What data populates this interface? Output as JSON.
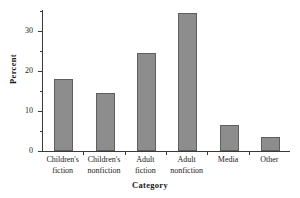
{
  "chart_data": {
    "type": "bar",
    "title": "",
    "xlabel": "Category",
    "ylabel": "Percent",
    "categories": [
      "Children's fiction",
      "Children's nonfiction",
      "Adult fiction",
      "Adult nonfiction",
      "Media",
      "Other"
    ],
    "category_lines": [
      [
        "Children's",
        "fiction"
      ],
      [
        "Children's",
        "nonfiction"
      ],
      [
        "Adult",
        "fiction"
      ],
      [
        "Adult",
        "nonfiction"
      ],
      [
        "Media",
        ""
      ],
      [
        "Other",
        ""
      ]
    ],
    "values": [
      18.1,
      14.4,
      24.5,
      34.4,
      6.5,
      3.5
    ],
    "ylim": [
      0,
      35.5
    ],
    "ytick_major": [
      0,
      10,
      20,
      30
    ],
    "ytick_major_labels": [
      "0",
      "10",
      "20",
      "30"
    ],
    "ytick_minor": [
      5,
      15,
      25,
      35
    ],
    "grid": false,
    "legend": null,
    "bar_color": "#8d8d8d",
    "bar_edge_color": "#5e5e5e",
    "axis_color": "#3a3a3a"
  }
}
